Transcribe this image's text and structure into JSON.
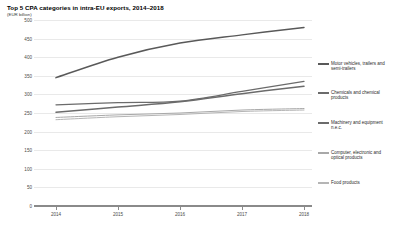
{
  "header": {
    "title": "Top 5 CPA categories in intra-EU exports, 2014–2018",
    "subtitle": "(EUR billion)"
  },
  "chart_data": {
    "type": "line",
    "title": "Top 5 CPA categories in intra-EU exports, 2014–2018",
    "subtitle": "(EUR billion)",
    "xlabel": "",
    "ylabel": "EUR billion",
    "x": [
      "2014",
      "2015",
      "2016",
      "2017",
      "2018"
    ],
    "ylim": [
      0,
      500
    ],
    "yticks": [
      "500",
      "450",
      "400",
      "350",
      "300",
      "250",
      "200",
      "150",
      "100",
      "50",
      "0"
    ],
    "ytick_values": [
      500,
      450,
      400,
      350,
      300,
      250,
      200,
      150,
      100,
      50,
      0
    ],
    "grid": true,
    "legend_position": "right",
    "series": [
      {
        "name": "Motor vehicles, trailers and\nsemi-trailers",
        "legend_label": "Motor vehicles, trailers and\nsemi-trailers",
        "color": "#595959",
        "width": 1.5,
        "values": [
          345,
          400,
          438,
          460,
          480
        ]
      },
      {
        "name": "Chemicals and chemical\nproducts",
        "legend_label": "Chemicals and chemical\nproducts",
        "color": "#6b6b6b",
        "width": 1.3,
        "values": [
          272,
          278,
          282,
          308,
          335
        ]
      },
      {
        "name": "Machinery and equipment\nn.e.c.",
        "legend_label": "Machinery and equipment\nn.e.c.",
        "color": "#6b6b6b",
        "width": 1.5,
        "values": [
          252,
          266,
          280,
          302,
          322
        ]
      },
      {
        "name": "Computer, electronic and\noptical products",
        "legend_label": "Computer, electronic and\noptical products",
        "color": "#a8a8a8",
        "width": 1.0,
        "values": [
          238,
          245,
          250,
          258,
          262
        ]
      },
      {
        "name": "Food products",
        "legend_label": "Food products",
        "color": "#b5b5b5",
        "width": 1.0,
        "values": [
          232,
          240,
          246,
          254,
          258
        ]
      }
    ]
  },
  "legend": {
    "items": [
      {
        "label": "Motor vehicles, trailers and\nsemi-trailers",
        "top": 21,
        "color": "#595959"
      },
      {
        "label": "Chemicals and chemical\nproducts",
        "top": 50,
        "color": "#6b6b6b"
      },
      {
        "label": "Machinery and equipment\nn.e.c.",
        "top": 80,
        "color": "#6b6b6b"
      },
      {
        "label": "Computer, electronic and\noptical products",
        "top": 110,
        "color": "#a8a8a8"
      },
      {
        "label": "Food products",
        "top": 140,
        "color": "#b5b5b5"
      }
    ]
  }
}
